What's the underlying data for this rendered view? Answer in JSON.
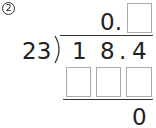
{
  "problem": {
    "number": "2",
    "quotient_prefix": "0.",
    "divisor": "23",
    "dividend": {
      "d1": "1",
      "d2": "8",
      "point": ".",
      "d3": "4"
    },
    "remainder": "0",
    "answer_boxes": {
      "quotient_blank": "",
      "product_blanks": [
        "",
        "",
        ""
      ]
    }
  }
}
